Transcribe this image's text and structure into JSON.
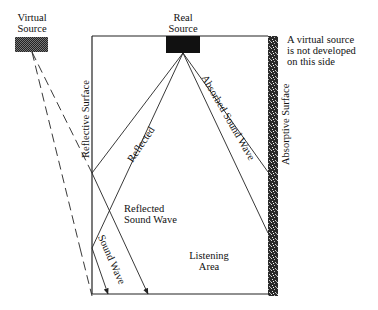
{
  "labels": {
    "virtual_source": [
      "Virtual",
      "Source"
    ],
    "real_source": [
      "Real",
      "Source"
    ],
    "note": [
      "A virtual source",
      "is not developed",
      "on this side"
    ],
    "reflective_surface": "Reflective Surface",
    "absorptive_surface": "Absorptive Surface",
    "reflected": "Reflected",
    "absorbed_sound_wave": "Absorbed Sound Wave",
    "reflected_sound_wave": [
      "Reflected",
      "Sound Wave"
    ],
    "sound_wave": "Sound Wave",
    "listening_area": [
      "Listening",
      "Area"
    ]
  },
  "colors": {
    "line": "#222222",
    "source_fill": "#111111",
    "virtual_fill": "#3a3a3a",
    "absorptive_fill": "#2a2a2a"
  }
}
